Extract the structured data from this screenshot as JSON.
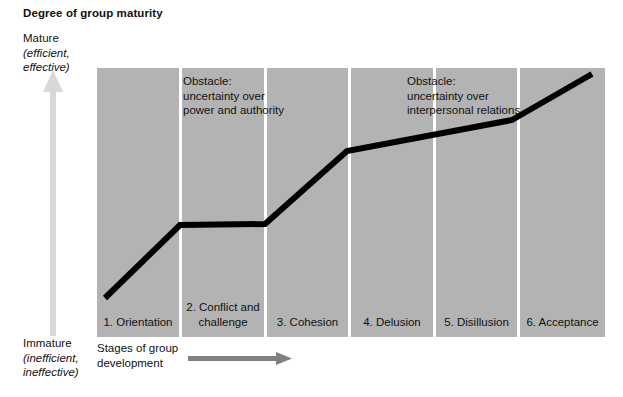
{
  "title": "Degree of group maturity",
  "axes": {
    "y_top": {
      "main": "Mature",
      "detail": "(efficient,",
      "detail2": "effective)"
    },
    "y_bottom": {
      "main": "Immature",
      "detail": "(inefficient,",
      "detail2": "ineffective)"
    },
    "x": {
      "line1": "Stages of group",
      "line2": "development"
    }
  },
  "annotations": [
    {
      "line1": "Obstacle:",
      "line2": "uncertainty over",
      "line3": "power and authority"
    },
    {
      "line1": "Obstacle:",
      "line2": "uncertainty over",
      "line3": "interpersonal relations"
    }
  ],
  "stages": [
    {
      "line1": "1. Orientation",
      "line2": ""
    },
    {
      "line1": "2. Conflict and",
      "line2": "challenge"
    },
    {
      "line1": "3. Cohesion",
      "line2": ""
    },
    {
      "line1": "4. Delusion",
      "line2": ""
    },
    {
      "line1": "5. Disillusion",
      "line2": ""
    },
    {
      "line1": "6. Acceptance",
      "line2": ""
    }
  ],
  "colors": {
    "panel": "#b3b3b3",
    "divider": "#ffffff",
    "line": "#000000",
    "vertical_arrow": "#d8d8d8",
    "horizontal_arrow": "#808080",
    "text": "#111111"
  },
  "chart_data": {
    "type": "line",
    "title": "Degree of group maturity",
    "xlabel": "Stages of group development",
    "ylabel": "Degree of group maturity",
    "categories": [
      "1. Orientation",
      "2. Conflict and challenge",
      "3. Cohesion",
      "4. Delusion",
      "5. Disillusion",
      "6. Acceptance"
    ],
    "points": [
      {
        "x": 8,
        "y": 230
      },
      {
        "x": 83,
        "y": 157
      },
      {
        "x": 168,
        "y": 156
      },
      {
        "x": 250,
        "y": 83
      },
      {
        "x": 415,
        "y": 52
      },
      {
        "x": 495,
        "y": 6
      }
    ],
    "grid": false,
    "legend": false
  }
}
